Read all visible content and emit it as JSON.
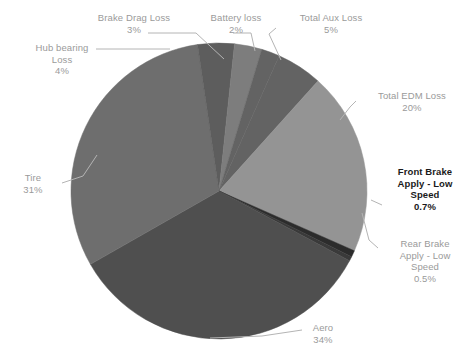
{
  "chart_data": {
    "type": "pie",
    "title": "",
    "subtitle": "",
    "xlabel": "",
    "ylabel": "",
    "legend_position": "none",
    "grid": false,
    "units": "percent",
    "labels": [
      "Aero",
      "Tire",
      "Hub bearing Loss",
      "Brake Drag Loss",
      "Battery loss",
      "Total Aux Loss",
      "Total EDM Loss",
      "Front Brake Apply - Low Speed",
      "Rear Brake Apply - Low Speed"
    ],
    "values": [
      34,
      31,
      4,
      3,
      2,
      5,
      20,
      0.7,
      0.5
    ],
    "value_labels": [
      "34%",
      "31%",
      "4%",
      "3%",
      "2%",
      "5%",
      "20%",
      "0.7%",
      "0.5%"
    ],
    "colors": [
      "#4f4f4f",
      "#6e6e6e",
      "#5d5d5d",
      "#7d7d7d",
      "#a8a8a8",
      "#636363",
      "#949494",
      "#2c2c2c",
      "#3a3a3a"
    ],
    "slices": [
      {
        "name": "Total Aux Loss",
        "value": 5,
        "value_label": "5%",
        "color": "#636363"
      },
      {
        "name": "Total EDM Loss",
        "value": 20,
        "value_label": "20%",
        "color": "#949494"
      },
      {
        "name": "Front Brake Apply - Low Speed",
        "value": 0.7,
        "value_label": "0.7%",
        "color": "#2c2c2c"
      },
      {
        "name": "Rear Brake Apply - Low Speed",
        "value": 0.5,
        "value_label": "0.5%",
        "color": "#3a3a3a"
      },
      {
        "name": "Aero",
        "value": 34,
        "value_label": "34%",
        "color": "#4f4f4f"
      },
      {
        "name": "Tire",
        "value": 31,
        "value_label": "31%",
        "color": "#6e6e6e"
      },
      {
        "name": "Hub bearing Loss",
        "value": 4,
        "value_label": "4%",
        "color": "#5d5d5d"
      },
      {
        "name": "Brake Drag Loss",
        "value": 3,
        "value_label": "3%",
        "color": "#7d7d7d"
      },
      {
        "name": "Battery loss",
        "value": 2,
        "value_label": "2%",
        "color": "#636363"
      }
    ]
  },
  "labels": {
    "brake_drag": {
      "line1": "Brake Drag Loss",
      "pct": "3%"
    },
    "battery": {
      "line1": "Battery loss",
      "pct": "2%"
    },
    "total_aux": {
      "line1": "Total Aux Loss",
      "pct": "5%"
    },
    "hub_bearing": {
      "line1": "Hub bearing",
      "line2": "Loss",
      "pct": "4%"
    },
    "total_edm": {
      "line1": "Total EDM Loss",
      "pct": "20%"
    },
    "tire": {
      "line1": "Tire",
      "pct": "31%"
    },
    "front_brake": {
      "line1": "Front Brake",
      "line2": "Apply - Low",
      "line3": "Speed",
      "pct": "0.7%"
    },
    "rear_brake": {
      "line1": "Rear Brake",
      "line2": "Apply - Low",
      "line3": "Speed",
      "pct": "0.5%"
    },
    "aero": {
      "line1": "Aero",
      "pct": "34%"
    }
  },
  "style": {
    "label_color": "#9a9a9a",
    "emphasis_color": "#1a1a1a",
    "background": "#ffffff",
    "leader_color": "#b4b4b4"
  }
}
